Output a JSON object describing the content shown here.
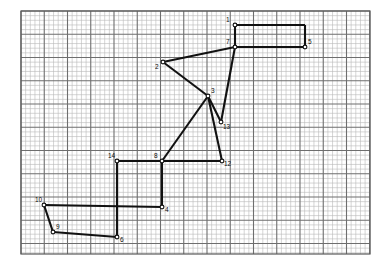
{
  "figure": {
    "colors": {
      "background": "#ffffff",
      "grid_minor": "#b9b9b9",
      "grid_major": "#6e6e6e",
      "frame": "#5a5a5a",
      "stroke": "#111111",
      "vertex_fill": "#ffffff",
      "label": "#0d0d0d"
    },
    "grid": {
      "left": 21,
      "top": 11,
      "right": 370,
      "bottom": 254,
      "minor_step": 4.65,
      "major_every": 5
    }
  },
  "chart_data": {
    "type": "scatter",
    "xlabel": "",
    "ylabel": "",
    "grid": true,
    "legend": "none",
    "xlim": [
      21,
      370
    ],
    "ylim": [
      254,
      11
    ],
    "points": [
      {
        "label": "1",
        "x": 235,
        "y": 25,
        "label_dx": -9,
        "label_dy": -9
      },
      {
        "label": "7",
        "x": 235,
        "y": 47,
        "label_dx": -9,
        "label_dy": -9
      },
      {
        "label": "5",
        "x": 305,
        "y": 47,
        "label_dx": 3,
        "label_dy": -9
      },
      {
        "label": "2",
        "x": 163,
        "y": 62,
        "label_dx": -8,
        "label_dy": 1
      },
      {
        "label": "3",
        "x": 208,
        "y": 96,
        "label_dx": 3,
        "label_dy": -9
      },
      {
        "label": "13",
        "x": 221,
        "y": 122,
        "label_dx": 2,
        "label_dy": 1
      },
      {
        "label": "14",
        "x": 117,
        "y": 161,
        "label_dx": -9,
        "label_dy": -9
      },
      {
        "label": "8",
        "x": 162,
        "y": 161,
        "label_dx": -8,
        "label_dy": -9
      },
      {
        "label": "12",
        "x": 222,
        "y": 161,
        "label_dx": 2,
        "label_dy": -1
      },
      {
        "label": "4",
        "x": 162,
        "y": 207,
        "label_dx": 3,
        "label_dy": -1
      },
      {
        "label": "10",
        "x": 44,
        "y": 205,
        "label_dx": -9,
        "label_dy": -9
      },
      {
        "label": "9",
        "x": 53,
        "y": 232,
        "label_dx": 3,
        "label_dy": -9
      },
      {
        "label": "6",
        "x": 117,
        "y": 237,
        "label_dx": 3,
        "label_dy": -1
      }
    ],
    "segments": [
      {
        "name": "1-to-topright",
        "from": [
          235,
          25
        ],
        "to": [
          305,
          25
        ]
      },
      {
        "name": "topright-to-5",
        "from": [
          305,
          25
        ],
        "to": [
          305,
          47
        ]
      },
      {
        "name": "5-to-7",
        "from": [
          305,
          47
        ],
        "to": [
          235,
          47
        ]
      },
      {
        "name": "7-to-2",
        "from": [
          235,
          47
        ],
        "to": [
          163,
          62
        ]
      },
      {
        "name": "1-to-7",
        "from": [
          235,
          25
        ],
        "to": [
          235,
          47
        ]
      },
      {
        "name": "7-to-13",
        "from": [
          235,
          47
        ],
        "to": [
          221,
          122
        ]
      },
      {
        "name": "13-to-3",
        "from": [
          221,
          122
        ],
        "to": [
          208,
          96
        ]
      },
      {
        "name": "3-to-2",
        "from": [
          208,
          96
        ],
        "to": [
          163,
          62
        ]
      },
      {
        "name": "3-to-8",
        "from": [
          208,
          96
        ],
        "to": [
          162,
          161
        ]
      },
      {
        "name": "3-to-12",
        "from": [
          208,
          96
        ],
        "to": [
          222,
          161
        ]
      },
      {
        "name": "12-to-8",
        "from": [
          222,
          161
        ],
        "to": [
          162,
          161
        ]
      },
      {
        "name": "8-to-14",
        "from": [
          162,
          161
        ],
        "to": [
          117,
          161
        ]
      },
      {
        "name": "14-to-lower",
        "from": [
          117,
          161
        ],
        "to": [
          117,
          237
        ]
      },
      {
        "name": "8-to-4",
        "from": [
          162,
          161
        ],
        "to": [
          162,
          207
        ]
      },
      {
        "name": "4-to-10",
        "from": [
          162,
          207
        ],
        "to": [
          44,
          205
        ]
      },
      {
        "name": "10-to-9",
        "from": [
          44,
          205
        ],
        "to": [
          53,
          232
        ]
      },
      {
        "name": "9-to-6",
        "from": [
          53,
          232
        ],
        "to": [
          117,
          237
        ]
      }
    ]
  }
}
